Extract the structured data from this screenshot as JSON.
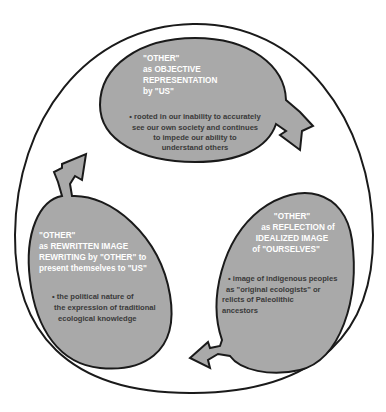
{
  "diagram": {
    "type": "cycle",
    "colors": {
      "fill": "#a9a9a9",
      "stroke": "#1a1a1a",
      "title_text": "#ffffff",
      "body_text": "#3a3a3a",
      "background": "#ffffff"
    },
    "nodes": [
      {
        "id": "top",
        "title_lines": [
          "\"OTHER\"",
          "as OBJECTIVE",
          "REPRESENTATION",
          "by \"US\""
        ],
        "bullet_lines": [
          "• rooted in our inability to accurately",
          "see our own society and continues",
          "to impede our ability to",
          "understand others"
        ]
      },
      {
        "id": "right",
        "title_lines": [
          "\"OTHER\"",
          "as REFLECTION of",
          "IDEALIZED IMAGE",
          "of \"OURSELVES\""
        ],
        "bullet_lines": [
          "• image of indigenous peoples",
          "as \"original ecologists\" or",
          "relicts of Paleolithic",
          "ancestors"
        ]
      },
      {
        "id": "left",
        "title_lines": [
          "\"OTHER\"",
          "as REWRITTEN IMAGE",
          "REWRITING by \"OTHER\" to",
          "present  themselves to \"US\""
        ],
        "bullet_lines": [
          "• the political nature of",
          "the expression of traditional",
          "ecological knowledge"
        ]
      }
    ],
    "arrows": [
      {
        "from": "top",
        "to": "right",
        "icon": "curved-arrow-icon"
      },
      {
        "from": "right",
        "to": "left",
        "icon": "curved-arrow-icon"
      },
      {
        "from": "left",
        "to": "top",
        "icon": "curved-arrow-icon"
      }
    ]
  }
}
